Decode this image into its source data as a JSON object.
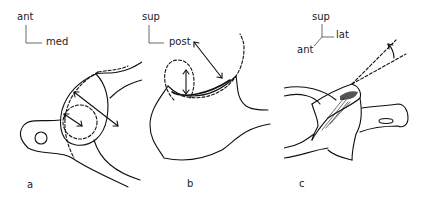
{
  "figure": {
    "panels": [
      {
        "id": "a",
        "label": "a",
        "axes": {
          "vertical": "ant",
          "horizontal": "med"
        },
        "description": "Glenoid/acetabular-like articular surface (view a) with inner and outer dashed circles and double-headed measurement arrows"
      },
      {
        "id": "b",
        "label": "b",
        "axes": {
          "vertical": "sup",
          "horizontal": "post"
        },
        "description": "Side profile of articular curvature with two dashed fitted circles and radius arrows"
      },
      {
        "id": "c",
        "label": "c",
        "axes": {
          "vertical": "sup",
          "horizontal": "lat",
          "oblique": "ant"
        },
        "description": "Oblique view with dashed reference lines and angle arrow"
      }
    ]
  }
}
